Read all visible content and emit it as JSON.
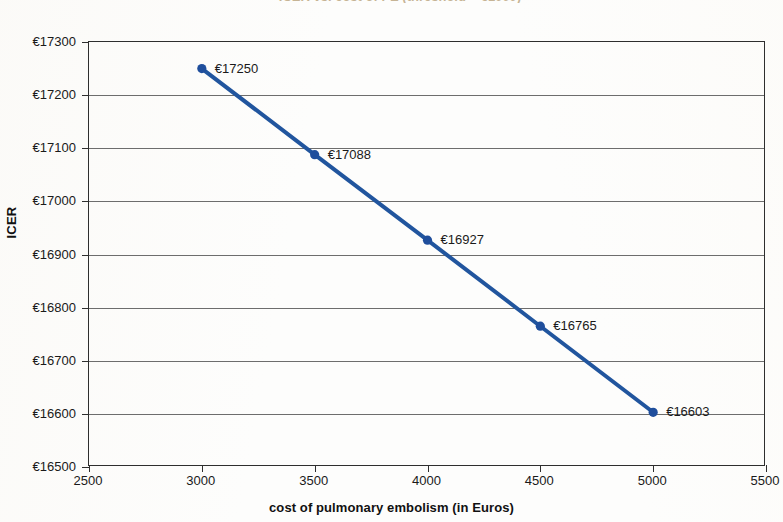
{
  "title_sliver": "ICER vs. cost of PE (threshold = €1000)",
  "axes": {
    "y_title": "ICER",
    "x_title": "cost of pulmonary embolism (in Euros)",
    "y_ticks": [
      "€16500",
      "€16600",
      "€16700",
      "€16800",
      "€16900",
      "€17000",
      "€17100",
      "€17200",
      "€17300"
    ],
    "x_ticks": [
      "2500",
      "3000",
      "3500",
      "4000",
      "4500",
      "5000",
      "5500"
    ]
  },
  "point_labels": [
    "€17250",
    "€17088",
    "€16927",
    "€16765",
    "€16603"
  ],
  "colors": {
    "series": "#21559E",
    "marker": "#1F4E9C",
    "grid": "#6d6d6d",
    "frame": "#2e2e2e",
    "text": "#1a1a1a"
  },
  "chart_data": {
    "type": "line",
    "title": "ICER vs. cost of PE (threshold = €1000)",
    "xlabel": "cost of pulmonary embolism (in Euros)",
    "ylabel": "ICER",
    "xlim": [
      2500,
      5500
    ],
    "ylim": [
      16500,
      17300
    ],
    "xtick_step": 500,
    "ytick_step": 100,
    "grid": "horizontal",
    "legend": "none",
    "x": [
      3000,
      3500,
      4000,
      4500,
      5000
    ],
    "y": [
      17250,
      17088,
      16927,
      16765,
      16603
    ],
    "data_labels": [
      "€17250",
      "€17088",
      "€16927",
      "€16765",
      "€16603"
    ],
    "series": [
      {
        "name": "ICER",
        "color": "#21559E",
        "marker": "circle",
        "values": [
          17250,
          17088,
          16927,
          16765,
          16603
        ]
      }
    ]
  }
}
